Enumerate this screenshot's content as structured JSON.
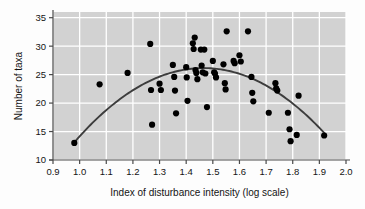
{
  "chart_data": {
    "type": "scatter",
    "title": "",
    "xlabel": "Index of disturbance intensity (log scale)",
    "ylabel": "Number of taxa",
    "xlim": [
      0.9,
      2.0
    ],
    "ylim": [
      10,
      36
    ],
    "xticks": [
      "0.9",
      "1.0",
      "1.1",
      "1.2",
      "1.3",
      "1.4",
      "1.5",
      "1.6",
      "1.7",
      "1.8",
      "1.9",
      "2.0"
    ],
    "xtick_values": [
      0.9,
      1.0,
      1.1,
      1.2,
      1.3,
      1.4,
      1.5,
      1.6,
      1.7,
      1.8,
      1.9,
      2.0
    ],
    "yticks": [
      "10",
      "15",
      "20",
      "25",
      "30",
      "35"
    ],
    "ytick_values": [
      10,
      15,
      20,
      25,
      30,
      35
    ],
    "grid": true,
    "grid_color": "#ffffff",
    "panel_color": "#d2d2d2",
    "point_color": "#000000",
    "point_radius": 3.1,
    "legend": "none",
    "series": [
      {
        "name": "taxa richness",
        "marker": "circle",
        "points": [
          [
            0.98,
            13.0
          ],
          [
            1.075,
            23.3
          ],
          [
            1.18,
            25.3
          ],
          [
            1.265,
            30.4
          ],
          [
            1.268,
            22.3
          ],
          [
            1.272,
            16.2
          ],
          [
            1.3,
            23.4
          ],
          [
            1.305,
            22.3
          ],
          [
            1.35,
            26.7
          ],
          [
            1.355,
            24.6
          ],
          [
            1.358,
            22.2
          ],
          [
            1.362,
            18.2
          ],
          [
            1.4,
            26.3
          ],
          [
            1.402,
            24.5
          ],
          [
            1.405,
            20.4
          ],
          [
            1.425,
            30.5
          ],
          [
            1.428,
            29.5
          ],
          [
            1.432,
            31.5
          ],
          [
            1.435,
            25.8
          ],
          [
            1.438,
            25.3
          ],
          [
            1.442,
            24.2
          ],
          [
            1.455,
            29.4
          ],
          [
            1.458,
            26.6
          ],
          [
            1.462,
            25.4
          ],
          [
            1.468,
            29.4
          ],
          [
            1.472,
            25.2
          ],
          [
            1.478,
            19.3
          ],
          [
            1.5,
            27.4
          ],
          [
            1.505,
            25.4
          ],
          [
            1.508,
            25.2
          ],
          [
            1.512,
            24.5
          ],
          [
            1.54,
            26.8
          ],
          [
            1.545,
            23.5
          ],
          [
            1.548,
            22.4
          ],
          [
            1.552,
            32.6
          ],
          [
            1.578,
            27.4
          ],
          [
            1.582,
            27.0
          ],
          [
            1.6,
            28.4
          ],
          [
            1.605,
            27.3
          ],
          [
            1.632,
            32.6
          ],
          [
            1.645,
            24.6
          ],
          [
            1.648,
            21.8
          ],
          [
            1.652,
            20.3
          ],
          [
            1.71,
            18.3
          ],
          [
            1.735,
            23.5
          ],
          [
            1.738,
            22.6
          ],
          [
            1.742,
            22.2
          ],
          [
            1.782,
            18.3
          ],
          [
            1.788,
            15.4
          ],
          [
            1.792,
            13.3
          ],
          [
            1.815,
            14.4
          ],
          [
            1.822,
            21.3
          ],
          [
            1.918,
            14.3
          ]
        ]
      }
    ],
    "fit_curve": {
      "name": "quadratic fit",
      "color": "#3d3d3d",
      "width": 1.9,
      "x_start": 0.978,
      "x_end": 1.925,
      "vertex_x": 1.465,
      "vertex_y": 26.15,
      "coefficients_note": "downward parabola"
    }
  }
}
